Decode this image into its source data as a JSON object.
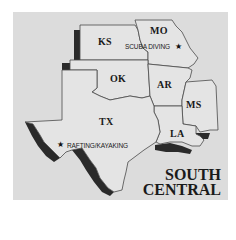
{
  "region_title": {
    "line1": "SOUTH",
    "line2": "CENTRAL"
  },
  "states": [
    {
      "abbr": "KS",
      "name": "Kansas"
    },
    {
      "abbr": "MO",
      "name": "Missouri"
    },
    {
      "abbr": "OK",
      "name": "Oklahoma"
    },
    {
      "abbr": "AR",
      "name": "Arkansas"
    },
    {
      "abbr": "MS",
      "name": "Mississippi"
    },
    {
      "abbr": "TX",
      "name": "Texas"
    },
    {
      "abbr": "LA",
      "name": "Louisiana"
    }
  ],
  "activities": [
    {
      "label": "SCUBA DIVING",
      "state": "MO",
      "marker": "★"
    },
    {
      "label": "RAFTING/KAYAKING",
      "state": "TX",
      "marker": "★"
    }
  ],
  "colors": {
    "background": "#ffffff",
    "panel": "#dcdcdc",
    "state_fill": "#e4e4e4",
    "border": "#4a4a4a",
    "shadow": "#2a2a2a"
  }
}
